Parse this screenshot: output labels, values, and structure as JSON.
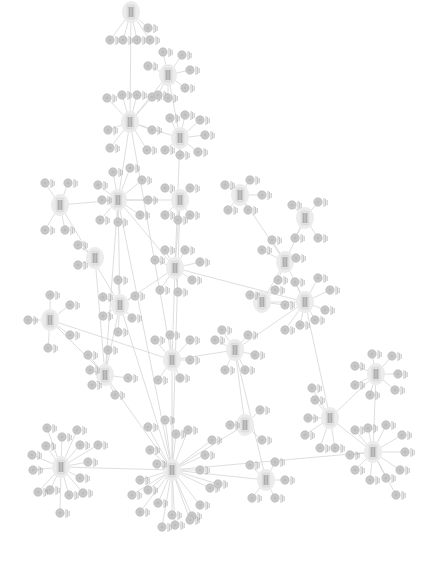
{
  "diagram": {
    "type": "network-graph",
    "orientation": "rotated-90",
    "colors": {
      "edge": "#d6d6d6",
      "leaf_node": "#c9c9c9",
      "hub_node": "#e2e2e2",
      "text": "#777777",
      "background": "#ffffff"
    },
    "hubs": [
      {
        "id": "h1",
        "x": 130,
        "y": 122,
        "leaves": [
          [
            107,
            98
          ],
          [
            122,
            95
          ],
          [
            137,
            95
          ],
          [
            152,
            97
          ],
          [
            108,
            130
          ],
          [
            152,
            130
          ],
          [
            110,
            148
          ],
          [
            147,
            150
          ]
        ]
      },
      {
        "id": "h2",
        "x": 168,
        "y": 75,
        "leaves": [
          [
            148,
            66
          ],
          [
            163,
            52
          ],
          [
            182,
            55
          ],
          [
            190,
            70
          ],
          [
            185,
            88
          ],
          [
            158,
            95
          ],
          [
            168,
            98
          ]
        ]
      },
      {
        "id": "h3",
        "x": 131,
        "y": 12,
        "leaves": [
          [
            110,
            40
          ],
          [
            123,
            40
          ],
          [
            137,
            40
          ],
          [
            150,
            40
          ],
          [
            148,
            28
          ]
        ]
      },
      {
        "id": "h4",
        "x": 180,
        "y": 138,
        "leaves": [
          [
            170,
            118
          ],
          [
            185,
            115
          ],
          [
            200,
            120
          ],
          [
            205,
            135
          ],
          [
            198,
            152
          ],
          [
            180,
            155
          ],
          [
            165,
            150
          ]
        ]
      },
      {
        "id": "h5",
        "x": 60,
        "y": 205,
        "leaves": [
          [
            45,
            183
          ],
          [
            68,
            183
          ],
          [
            45,
            230
          ],
          [
            65,
            230
          ]
        ]
      },
      {
        "id": "h6",
        "x": 118,
        "y": 200,
        "leaves": [
          [
            98,
            185
          ],
          [
            113,
            172
          ],
          [
            130,
            168
          ],
          [
            142,
            180
          ],
          [
            148,
            200
          ],
          [
            140,
            215
          ],
          [
            100,
            220
          ],
          [
            118,
            222
          ],
          [
            102,
            200
          ]
        ]
      },
      {
        "id": "h7",
        "x": 180,
        "y": 200,
        "leaves": [
          [
            165,
            188
          ],
          [
            190,
            188
          ],
          [
            165,
            215
          ],
          [
            190,
            215
          ],
          [
            178,
            220
          ]
        ]
      },
      {
        "id": "h8",
        "x": 95,
        "y": 258,
        "leaves": [
          [
            78,
            245
          ],
          [
            78,
            265
          ]
        ]
      },
      {
        "id": "h9",
        "x": 175,
        "y": 268,
        "leaves": [
          [
            155,
            260
          ],
          [
            165,
            250
          ],
          [
            185,
            250
          ],
          [
            200,
            262
          ],
          [
            192,
            280
          ],
          [
            160,
            290
          ],
          [
            178,
            292
          ]
        ]
      },
      {
        "id": "h10",
        "x": 120,
        "y": 305,
        "leaves": [
          [
            118,
            280
          ],
          [
            103,
            297
          ],
          [
            103,
            316
          ],
          [
            135,
            296
          ],
          [
            132,
            318
          ],
          [
            118,
            332
          ]
        ]
      },
      {
        "id": "h11",
        "x": 50,
        "y": 320,
        "leaves": [
          [
            50,
            295
          ],
          [
            70,
            305
          ],
          [
            28,
            320
          ],
          [
            70,
            335
          ],
          [
            48,
            348
          ]
        ]
      },
      {
        "id": "h12",
        "x": 105,
        "y": 375,
        "leaves": [
          [
            88,
            355
          ],
          [
            108,
            350
          ],
          [
            92,
            385
          ],
          [
            90,
            370
          ],
          [
            115,
            395
          ],
          [
            128,
            378
          ]
        ]
      },
      {
        "id": "h13",
        "x": 172,
        "y": 360,
        "leaves": [
          [
            155,
            340
          ],
          [
            170,
            335
          ],
          [
            190,
            340
          ],
          [
            158,
            380
          ],
          [
            180,
            378
          ],
          [
            190,
            360
          ]
        ]
      },
      {
        "id": "h14",
        "x": 240,
        "y": 195,
        "leaves": [
          [
            225,
            185
          ],
          [
            250,
            180
          ],
          [
            262,
            195
          ],
          [
            248,
            210
          ],
          [
            228,
            210
          ]
        ]
      },
      {
        "id": "h15",
        "x": 305,
        "y": 218,
        "leaves": [
          [
            292,
            205
          ],
          [
            318,
            202
          ],
          [
            295,
            238
          ],
          [
            318,
            238
          ]
        ]
      },
      {
        "id": "h16",
        "x": 285,
        "y": 262,
        "leaves": [
          [
            262,
            250
          ],
          [
            272,
            240
          ],
          [
            296,
            258
          ],
          [
            278,
            280
          ]
        ]
      },
      {
        "id": "h17",
        "x": 262,
        "y": 302,
        "leaves": [
          [
            250,
            295
          ],
          [
            275,
            290
          ],
          [
            285,
            305
          ]
        ]
      },
      {
        "id": "h18",
        "x": 305,
        "y": 302,
        "leaves": [
          [
            295,
            282
          ],
          [
            318,
            278
          ],
          [
            330,
            290
          ],
          [
            325,
            310
          ],
          [
            315,
            320
          ],
          [
            300,
            325
          ],
          [
            285,
            330
          ]
        ]
      },
      {
        "id": "h19",
        "x": 235,
        "y": 350,
        "leaves": [
          [
            215,
            340
          ],
          [
            222,
            330
          ],
          [
            248,
            335
          ],
          [
            255,
            355
          ],
          [
            245,
            370
          ],
          [
            225,
            370
          ]
        ]
      },
      {
        "id": "h20",
        "x": 330,
        "y": 418,
        "leaves": [
          [
            315,
            400
          ],
          [
            308,
            418
          ],
          [
            305,
            435
          ],
          [
            320,
            448
          ],
          [
            335,
            448
          ],
          [
            312,
            388
          ]
        ]
      },
      {
        "id": "h21",
        "x": 376,
        "y": 374,
        "leaves": [
          [
            355,
            366
          ],
          [
            372,
            354
          ],
          [
            392,
            356
          ],
          [
            398,
            374
          ],
          [
            395,
            390
          ],
          [
            370,
            395
          ],
          [
            355,
            385
          ]
        ]
      },
      {
        "id": "h22",
        "x": 373,
        "y": 452,
        "leaves": [
          [
            355,
            430
          ],
          [
            368,
            428
          ],
          [
            386,
            425
          ],
          [
            402,
            435
          ],
          [
            405,
            452
          ],
          [
            400,
            470
          ],
          [
            386,
            478
          ],
          [
            370,
            480
          ],
          [
            355,
            470
          ],
          [
            350,
            455
          ],
          [
            396,
            495
          ]
        ]
      },
      {
        "id": "h23",
        "x": 61,
        "y": 467,
        "leaves": [
          [
            47,
            428
          ],
          [
            62,
            437
          ],
          [
            77,
            430
          ],
          [
            80,
            445
          ],
          [
            88,
            462
          ],
          [
            80,
            478
          ],
          [
            83,
            493
          ],
          [
            69,
            495
          ],
          [
            50,
            490
          ],
          [
            38,
            492
          ],
          [
            33,
            470
          ],
          [
            32,
            455
          ],
          [
            46,
            446
          ],
          [
            98,
            445
          ],
          [
            60,
            513
          ]
        ]
      },
      {
        "id": "h24",
        "x": 172,
        "y": 470,
        "leaves": [
          [
            148,
            427
          ],
          [
            165,
            420
          ],
          [
            176,
            434
          ],
          [
            188,
            430
          ],
          [
            150,
            450
          ],
          [
            157,
            464
          ],
          [
            140,
            480
          ],
          [
            132,
            495
          ],
          [
            148,
            490
          ],
          [
            158,
            503
          ],
          [
            140,
            512
          ],
          [
            172,
            515
          ],
          [
            192,
            516
          ],
          [
            200,
            505
          ],
          [
            210,
            488
          ],
          [
            200,
            470
          ],
          [
            205,
            455
          ],
          [
            212,
            440
          ],
          [
            218,
            484
          ],
          [
            190,
            520
          ],
          [
            162,
            527
          ],
          [
            175,
            525
          ]
        ]
      },
      {
        "id": "h25",
        "x": 245,
        "y": 425,
        "leaves": [
          [
            230,
            425
          ],
          [
            260,
            410
          ],
          [
            262,
            440
          ]
        ]
      },
      {
        "id": "h26",
        "x": 266,
        "y": 480,
        "leaves": [
          [
            250,
            465
          ],
          [
            275,
            462
          ],
          [
            285,
            480
          ],
          [
            275,
            498
          ],
          [
            252,
            498
          ]
        ]
      }
    ],
    "hub_links": [
      [
        "h1",
        "h3"
      ],
      [
        "h1",
        "h2"
      ],
      [
        "h1",
        "h4"
      ],
      [
        "h1",
        "h6"
      ],
      [
        "h2",
        "h4"
      ],
      [
        "h6",
        "h5"
      ],
      [
        "h6",
        "h7"
      ],
      [
        "h6",
        "h9"
      ],
      [
        "h6",
        "h10"
      ],
      [
        "h6",
        "h12"
      ],
      [
        "h7",
        "h9"
      ],
      [
        "h9",
        "h10"
      ],
      [
        "h9",
        "h13"
      ],
      [
        "h10",
        "h12"
      ],
      [
        "h10",
        "h24"
      ],
      [
        "h11",
        "h13"
      ],
      [
        "h12",
        "h24"
      ],
      [
        "h13",
        "h24"
      ],
      [
        "h13",
        "h19"
      ],
      [
        "h14",
        "h16"
      ],
      [
        "h15",
        "h16"
      ],
      [
        "h16",
        "h18"
      ],
      [
        "h16",
        "h17"
      ],
      [
        "h17",
        "h18"
      ],
      [
        "h18",
        "h19"
      ],
      [
        "h18",
        "h20"
      ],
      [
        "h20",
        "h21"
      ],
      [
        "h20",
        "h22"
      ],
      [
        "h21",
        "h22"
      ],
      [
        "h23",
        "h24"
      ],
      [
        "h24",
        "h25"
      ],
      [
        "h24",
        "h26"
      ],
      [
        "h25",
        "h19"
      ],
      [
        "h9",
        "h18"
      ],
      [
        "h4",
        "h9"
      ],
      [
        "h5",
        "h10"
      ],
      [
        "h1",
        "h13"
      ],
      [
        "h8",
        "h12"
      ],
      [
        "h7",
        "h24"
      ],
      [
        "h6",
        "h24"
      ],
      [
        "h11",
        "h12"
      ],
      [
        "h19",
        "h26"
      ],
      [
        "h22",
        "h24"
      ]
    ]
  }
}
